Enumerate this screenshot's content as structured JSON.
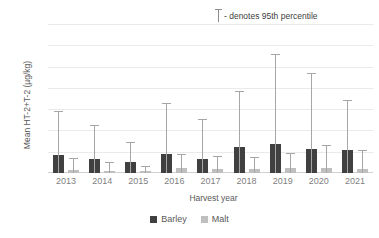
{
  "annotation": {
    "glyph_name": "error-bar-glyph",
    "text": "- denotes 95th percentile"
  },
  "axes": {
    "ylabel": "Mean HT-2+T-2 (µg/kg)",
    "xlabel": "Harvest year",
    "yticks": [
      "0",
      "20",
      "40",
      "60",
      "80",
      "100",
      "120",
      "140"
    ]
  },
  "legend": {
    "items": [
      {
        "label": "Barley",
        "color": "#404040"
      },
      {
        "label": "Malt",
        "color": "#bfbfbf"
      }
    ]
  },
  "chart_data": {
    "type": "bar",
    "title": "",
    "xlabel": "Harvest year",
    "ylabel": "Mean HT-2+T-2 (µg/kg)",
    "ylim": [
      0,
      140
    ],
    "ytick_values": [
      0,
      20,
      40,
      60,
      80,
      100,
      120,
      140
    ],
    "grid": true,
    "legend_position": "bottom",
    "annotation": "- denotes 95th percentile",
    "categories": [
      "2013",
      "2014",
      "2015",
      "2016",
      "2017",
      "2018",
      "2019",
      "2020",
      "2021"
    ],
    "series": [
      {
        "name": "Barley",
        "color": "#404040",
        "values": [
          17,
          13,
          10,
          18,
          13,
          24,
          27,
          23,
          22
        ],
        "errorbar_top_95th": [
          57,
          44,
          28,
          65,
          50,
          76,
          111,
          93,
          68
        ]
      },
      {
        "name": "Malt",
        "color": "#bfbfbf",
        "values": [
          3,
          2,
          2,
          5,
          4,
          4,
          5,
          5,
          4
        ],
        "errorbar_top_95th": [
          13,
          9,
          6,
          17,
          15,
          14,
          18,
          25,
          21
        ]
      }
    ]
  }
}
